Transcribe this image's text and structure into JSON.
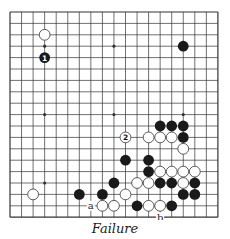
{
  "diagram": {
    "type": "go-board",
    "size": 19,
    "caption": "Failure",
    "colors": {
      "line": "#333333",
      "black": "#1a1a1a",
      "white": "#ffffff",
      "background": "#ffffff"
    },
    "hoshi": [
      [
        3,
        3
      ],
      [
        9,
        3
      ],
      [
        15,
        3
      ],
      [
        3,
        9
      ],
      [
        9,
        9
      ],
      [
        15,
        9
      ],
      [
        3,
        15
      ],
      [
        9,
        15
      ],
      [
        15,
        15
      ]
    ],
    "black_stones": [
      {
        "col": 3,
        "row": 4,
        "label": "1"
      },
      {
        "col": 15,
        "row": 3
      },
      {
        "col": 13,
        "row": 10
      },
      {
        "col": 14,
        "row": 10
      },
      {
        "col": 15,
        "row": 10
      },
      {
        "col": 15,
        "row": 11
      },
      {
        "col": 10,
        "row": 13
      },
      {
        "col": 12,
        "row": 13
      },
      {
        "col": 12,
        "row": 14
      },
      {
        "col": 9,
        "row": 15
      },
      {
        "col": 13,
        "row": 15
      },
      {
        "col": 14,
        "row": 15
      },
      {
        "col": 16,
        "row": 15
      },
      {
        "col": 6,
        "row": 16
      },
      {
        "col": 8,
        "row": 16
      },
      {
        "col": 15,
        "row": 16
      },
      {
        "col": 16,
        "row": 16
      },
      {
        "col": 11,
        "row": 17
      },
      {
        "col": 14,
        "row": 17
      }
    ],
    "white_stones": [
      {
        "col": 3,
        "row": 2
      },
      {
        "col": 10,
        "row": 11,
        "label": "2"
      },
      {
        "col": 12,
        "row": 11
      },
      {
        "col": 13,
        "row": 11
      },
      {
        "col": 14,
        "row": 11
      },
      {
        "col": 15,
        "row": 12
      },
      {
        "col": 13,
        "row": 14
      },
      {
        "col": 14,
        "row": 14
      },
      {
        "col": 15,
        "row": 14
      },
      {
        "col": 16,
        "row": 14
      },
      {
        "col": 11,
        "row": 15
      },
      {
        "col": 12,
        "row": 15
      },
      {
        "col": 15,
        "row": 15
      },
      {
        "col": 2,
        "row": 16
      },
      {
        "col": 10,
        "row": 16
      },
      {
        "col": 8,
        "row": 17
      },
      {
        "col": 9,
        "row": 17
      },
      {
        "col": 12,
        "row": 17
      },
      {
        "col": 13,
        "row": 17
      }
    ],
    "point_labels": [
      {
        "col": 7,
        "row": 17,
        "text": "a"
      },
      {
        "col": 13,
        "row": 18,
        "text": "b"
      }
    ]
  }
}
